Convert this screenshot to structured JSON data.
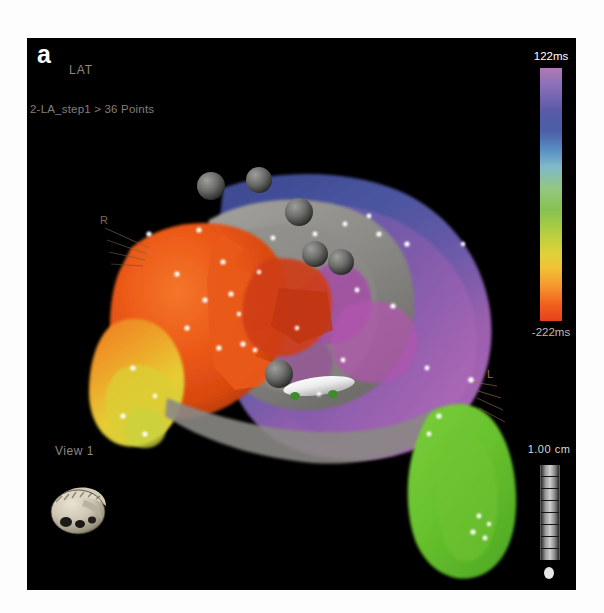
{
  "panel": {
    "letter": "a",
    "map_type": "LAT",
    "breadcrumb": "2-LA_step1 > 36 Points",
    "view_label": "View 1",
    "background_color": "#000000"
  },
  "colorbar": {
    "max_label": "122ms",
    "min_label": "-222ms",
    "max_value": 122,
    "min_value": -222,
    "units": "ms",
    "colors_top_to_bottom": [
      "#b07ab5",
      "#5a5aa8",
      "#5a93c4",
      "#7fb9c9",
      "#93c77f",
      "#b8cf3f",
      "#ddd23a",
      "#f59830",
      "#e8401a"
    ]
  },
  "scale": {
    "label": "1.00 cm",
    "value": 1.0,
    "units": "cm"
  },
  "annotations": {
    "right_label": "R",
    "left_label": "L"
  },
  "icons": {
    "orientation_icon": "heart-orientation-icon",
    "ruler_icon": "ruler-icon"
  },
  "map_content": {
    "name": "left-atrium-lat-map",
    "points_count": 36,
    "regions": [
      {
        "name": "early-activation-anterior",
        "color": "#e8521c",
        "lat_ms": -200
      },
      {
        "name": "early-activation-inferior",
        "color": "#e8c22a",
        "lat_ms": -150
      },
      {
        "name": "scar-region",
        "color": "#8f8f8f",
        "lat_ms": null
      },
      {
        "name": "late-activation-posterior",
        "color": "#4a5aa0",
        "lat_ms": 60
      },
      {
        "name": "late-activation-lateral",
        "color": "#a964b0",
        "lat_ms": 110
      },
      {
        "name": "appendage",
        "color": "#6cc032",
        "lat_ms": -30
      }
    ],
    "lesion_tags": 6,
    "catheter": "mapping-catheter"
  }
}
